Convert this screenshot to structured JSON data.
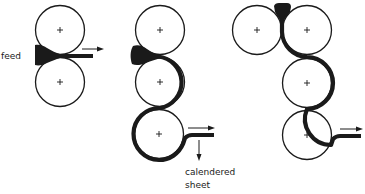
{
  "diagram": {
    "labels": {
      "feed": "feed",
      "output_line1": "calendered",
      "output_line2": "sheet"
    },
    "configurations": [
      {
        "name": "two-roll",
        "rolls": 2
      },
      {
        "name": "three-roll-vertical",
        "rolls": 3
      },
      {
        "name": "four-roll-inverted-L",
        "rolls": 4
      }
    ],
    "colors": {
      "stroke": "#1a1a1a",
      "fill": "#ffffff"
    }
  }
}
